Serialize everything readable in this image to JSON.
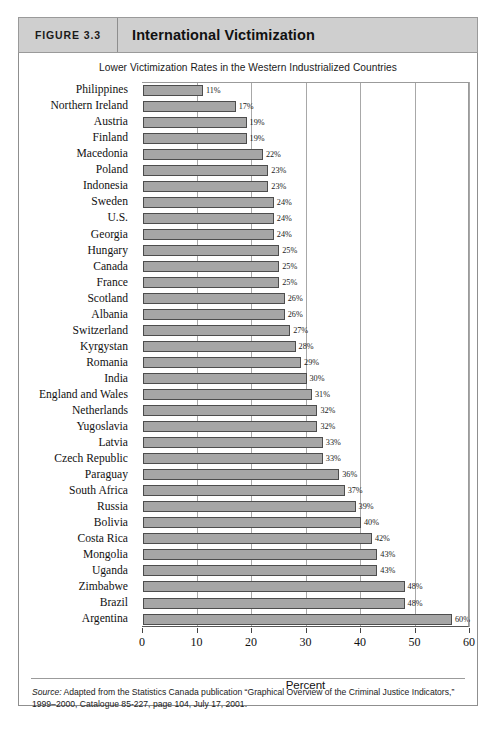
{
  "figure": {
    "number_label": "FIGURE 3.3",
    "title": "International Victimization"
  },
  "source": {
    "label": "Source:",
    "text": " Adapted from the Statistics Canada publication “Graphical Overview of the Criminal Justice Indicators,” 1999–2000, Catalogue 85-227, page 104, July 17, 2001."
  },
  "colors": {
    "header_bg": "#cfcfcf",
    "bar_fill": "#a6a6a6",
    "bar_stroke": "#4d4d4d",
    "grid": "#a8a8a8",
    "text": "#111111"
  },
  "chart_data": {
    "type": "bar",
    "orientation": "horizontal",
    "title": "Lower Victimization Rates in the Western Industrialized Countries",
    "xlabel": "Percent",
    "ylabel": "",
    "xlim": [
      0,
      60
    ],
    "xticks": [
      0,
      10,
      20,
      30,
      40,
      50,
      60
    ],
    "xtick_labels": [
      "0",
      "10",
      "20",
      "30",
      "40",
      "50",
      "60"
    ],
    "grid": true,
    "legend": false,
    "value_label_suffix": "%",
    "categories": [
      "Philippines",
      "Northern Ireland",
      "Austria",
      "Finland",
      "Macedonia",
      "Poland",
      "Indonesia",
      "Sweden",
      "U.S.",
      "Georgia",
      "Hungary",
      "Canada",
      "France",
      "Scotland",
      "Albania",
      "Switzerland",
      "Kyrgystan",
      "Romania",
      "India",
      "England and Wales",
      "Netherlands",
      "Yugoslavia",
      "Latvia",
      "Czech Republic",
      "Paraguay",
      "South Africa",
      "Russia",
      "Bolivia",
      "Costa Rica",
      "Mongolia",
      "Uganda",
      "Zimbabwe",
      "Brazil",
      "Argentina"
    ],
    "values": [
      11,
      17,
      19,
      19,
      22,
      23,
      23,
      24,
      24,
      24,
      25,
      25,
      25,
      26,
      26,
      27,
      28,
      29,
      30,
      31,
      32,
      32,
      33,
      33,
      36,
      37,
      39,
      40,
      42,
      43,
      43,
      48,
      48,
      60
    ],
    "value_labels": [
      "11%",
      "17%",
      "19%",
      "19%",
      "22%",
      "23%",
      "23%",
      "24%",
      "24%",
      "24%",
      "25%",
      "25%",
      "25%",
      "26%",
      "26%",
      "27%",
      "28%",
      "29%",
      "30%",
      "31%",
      "32%",
      "32%",
      "33%",
      "33%",
      "36%",
      "37%",
      "39%",
      "40%",
      "42%",
      "43%",
      "43%",
      "48%",
      "48%",
      "60%"
    ]
  }
}
